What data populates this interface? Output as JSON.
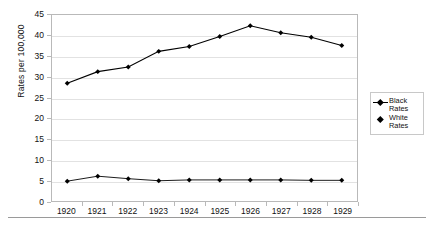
{
  "chart_data": {
    "type": "line",
    "title": "",
    "xlabel": "",
    "ylabel": "Rates per 100,000",
    "categories": [
      "1920",
      "1921",
      "1922",
      "1923",
      "1924",
      "1925",
      "1926",
      "1927",
      "1928",
      "1929"
    ],
    "ylim": [
      0,
      45
    ],
    "ytick_step": 5,
    "yticks": [
      "0",
      "5",
      "10",
      "15",
      "20",
      "25",
      "30",
      "35",
      "40",
      "45"
    ],
    "grid": true,
    "legend_position": "right",
    "series": [
      {
        "name": "Black Rates",
        "label_line1": "Black",
        "label_line2": "Rates",
        "marker": "diamond",
        "color": "#000000",
        "values": [
          28.5,
          31.3,
          32.4,
          36.2,
          37.4,
          39.8,
          42.4,
          40.7,
          39.6,
          37.6
        ]
      },
      {
        "name": "White Rates",
        "label_line1": "White",
        "label_line2": "Rates",
        "marker": "diamond",
        "color": "#000000",
        "values": [
          4.8,
          6.0,
          5.4,
          4.9,
          5.1,
          5.1,
          5.1,
          5.1,
          5.0,
          5.0
        ]
      }
    ]
  }
}
